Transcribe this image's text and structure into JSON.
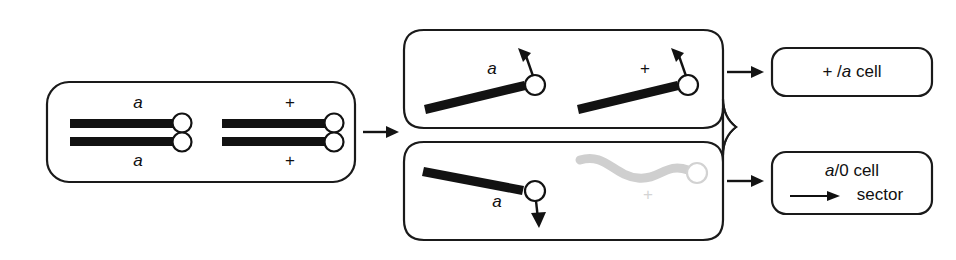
{
  "figure": {
    "background_color": "#ffffff",
    "ink_color": "#121212",
    "faded_color": "#cfcfcf"
  },
  "panels": {
    "parent": {
      "name": "parent diploid cell",
      "chromosome_pairs": [
        {
          "name": "a-homolog",
          "top_label": "a",
          "bottom_label": "a",
          "label_style": "italic"
        },
        {
          "name": "plus-homolog",
          "top_label": "+",
          "bottom_label": "+",
          "label_style": "roman"
        }
      ]
    },
    "daughter_top": {
      "name": "upper daughter cell",
      "chromatids": [
        {
          "label": "a",
          "label_style": "italic",
          "spindle": "up",
          "state": "normal"
        },
        {
          "label": "+",
          "label_style": "roman",
          "spindle": "up",
          "state": "normal"
        }
      ]
    },
    "daughter_bottom": {
      "name": "lower daughter cell",
      "chromatids": [
        {
          "label": "a",
          "label_style": "italic",
          "spindle": "down",
          "state": "normal"
        },
        {
          "label": "+",
          "label_style": "roman",
          "spindle": "none",
          "state": "lost"
        }
      ]
    }
  },
  "results": {
    "top": {
      "name": "plus-over-a cell",
      "line1_prefix": "+ /",
      "line1_italic": "a",
      "line1_suffix": " cell"
    },
    "bottom": {
      "name": "a-over-zero sectored cell",
      "line1_italic": "a",
      "line1_suffix": "/0 cell",
      "line2": "sector"
    }
  },
  "arrows": {
    "parent_to_daughters": "arrow-right",
    "top_to_result": "arrow-right",
    "bottom_to_result": "arrow-right",
    "sector_marker": "arrow-right"
  }
}
